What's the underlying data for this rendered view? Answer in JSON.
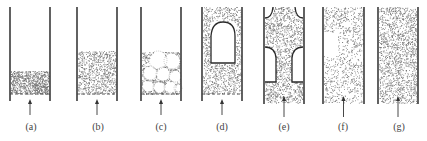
{
  "figure": {
    "colors": {
      "wall": "#3a3a3a",
      "particle": "#6b6b6b",
      "outline": "#2a2a2a",
      "background": "#ffffff"
    },
    "panels": [
      {
        "id": "a",
        "label": "(a)",
        "regime": "fixed bed",
        "x_left": 10,
        "x_right": 50,
        "wall_top": 7,
        "wall_bottom": 101,
        "bed_top": 71,
        "distributor": true,
        "density": "dense"
      },
      {
        "id": "b",
        "label": "(b)",
        "regime": "minimum / homogeneous fluidization",
        "x_left": 77,
        "x_right": 117,
        "wall_top": 7,
        "wall_bottom": 101,
        "bed_top": 51,
        "distributor": true,
        "density": "medium"
      },
      {
        "id": "c",
        "label": "(c)",
        "regime": "bubbling fluidization",
        "x_left": 141,
        "x_right": 181,
        "wall_top": 7,
        "wall_bottom": 101,
        "bed_top": 52,
        "distributor": true,
        "density": "bubbles"
      },
      {
        "id": "d",
        "label": "(d)",
        "regime": "axial slugging",
        "x_left": 202,
        "x_right": 242,
        "wall_top": 7,
        "wall_bottom": 101,
        "bed_top": 7,
        "distributor": true,
        "density": "medium"
      },
      {
        "id": "e",
        "label": "(e)",
        "regime": "wall slugging",
        "x_left": 264,
        "x_right": 304,
        "wall_top": 7,
        "wall_bottom": 104,
        "bed_top": 7,
        "distributor": false,
        "density": "medium"
      },
      {
        "id": "f",
        "label": "(f)",
        "regime": "turbulent fluidization",
        "x_left": 323,
        "x_right": 364,
        "wall_top": 7,
        "wall_bottom": 104,
        "bed_top": 7,
        "distributor": false,
        "density": "sparse"
      },
      {
        "id": "g",
        "label": "(g)",
        "regime": "pneumatic transport",
        "x_left": 378,
        "x_right": 418,
        "wall_top": 7,
        "wall_bottom": 104,
        "bed_top": 7,
        "distributor": false,
        "density": "medium"
      }
    ]
  }
}
